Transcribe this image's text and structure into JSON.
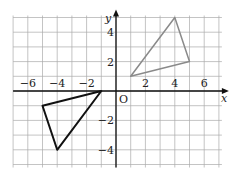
{
  "chart_data": {
    "type": "scatter",
    "title": "",
    "xlabel": "x",
    "ylabel": "y",
    "origin_label": "O",
    "xlim": [
      -7,
      7
    ],
    "ylim": [
      -5,
      5
    ],
    "grid": true,
    "x_ticks": [
      -6,
      -4,
      -2,
      2,
      4,
      6
    ],
    "y_ticks": [
      4,
      2,
      -2,
      -4
    ],
    "x_tick_labels": [
      "−6",
      "−4",
      "−2",
      "2",
      "4",
      "6"
    ],
    "y_tick_labels": [
      "4",
      "2",
      "−2",
      "−4"
    ],
    "series": [
      {
        "name": "black-triangle",
        "color": "#111111",
        "points": [
          [
            -1,
            0
          ],
          [
            -5,
            -1
          ],
          [
            -4,
            -4
          ]
        ]
      },
      {
        "name": "gray-triangle",
        "color": "#8a8a8a",
        "points": [
          [
            1,
            1
          ],
          [
            4,
            5
          ],
          [
            5,
            2
          ]
        ]
      }
    ]
  }
}
